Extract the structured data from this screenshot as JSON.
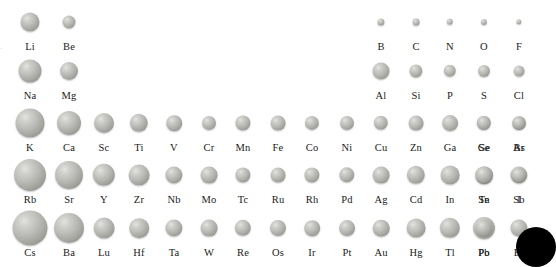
{
  "figure": {
    "type": "scaled-sphere periodic layout",
    "background_color": "#ffffff",
    "sphere_color": "#b4b4b0",
    "label_color": "#1a1a1a",
    "corner_marker_color": "#000000",
    "edge_mark": "."
  },
  "layout": {
    "column_x": [
      30,
      69,
      104,
      139,
      174,
      209,
      243,
      278,
      312,
      347,
      381,
      416,
      450,
      484,
      519
    ],
    "group_columns": 15,
    "row_label_offset_px": 19
  },
  "chart_data": {
    "type": "scatter",
    "xlabel": "",
    "ylabel": "",
    "value_name": "atomic_radius_relative",
    "legend": [],
    "rows": [
      {
        "name": "period-2",
        "sphere_center_y": 22,
        "label_y": 41,
        "elements": [
          {
            "symbol": "Li",
            "col": 0,
            "radius": 9.5
          },
          {
            "symbol": "Be",
            "col": 1,
            "radius": 6.5
          },
          {
            "symbol": "B",
            "col": 10,
            "radius": 3.6
          },
          {
            "symbol": "C",
            "col": 11,
            "radius": 3.4
          },
          {
            "symbol": "N",
            "col": 12,
            "radius": 3.2
          },
          {
            "symbol": "O",
            "col": 13,
            "radius": 3.1
          },
          {
            "symbol": "F",
            "col": 14,
            "radius": 2.7
          }
        ]
      },
      {
        "name": "period-3",
        "sphere_center_y": 71,
        "label_y": 90,
        "elements": [
          {
            "symbol": "Na",
            "col": 0,
            "radius": 11.5
          },
          {
            "symbol": "Mg",
            "col": 1,
            "radius": 9.0
          },
          {
            "symbol": "Al",
            "col": 10,
            "radius": 8.5
          },
          {
            "symbol": "Si",
            "col": 11,
            "radius": 6.6
          },
          {
            "symbol": "P",
            "col": 12,
            "radius": 6.2
          },
          {
            "symbol": "S",
            "col": 13,
            "radius": 6.0
          },
          {
            "symbol": "Cl",
            "col": 14,
            "radius": 5.4
          }
        ]
      },
      {
        "name": "period-4",
        "sphere_center_y": 123,
        "label_y": 142,
        "elements": [
          {
            "symbol": "K",
            "col": 0,
            "radius": 14.5
          },
          {
            "symbol": "Ca",
            "col": 1,
            "radius": 12.0
          },
          {
            "symbol": "Sc",
            "col": 2,
            "radius": 10.0
          },
          {
            "symbol": "Ti",
            "col": 3,
            "radius": 9.2
          },
          {
            "symbol": "V",
            "col": 4,
            "radius": 7.8
          },
          {
            "symbol": "Cr",
            "col": 5,
            "radius": 7.0
          },
          {
            "symbol": "Mn",
            "col": 6,
            "radius": 7.6
          },
          {
            "symbol": "Fe",
            "col": 7,
            "radius": 7.4
          },
          {
            "symbol": "Co",
            "col": 8,
            "radius": 7.1
          },
          {
            "symbol": "Ni",
            "col": 9,
            "radius": 7.0
          },
          {
            "symbol": "Cu",
            "col": 10,
            "radius": 7.2
          },
          {
            "symbol": "Zn",
            "col": 11,
            "radius": 7.4
          },
          {
            "symbol": "Ga",
            "col": 12,
            "radius": 7.9
          },
          {
            "symbol": "Ge",
            "col": 13,
            "radius": 7.2
          },
          {
            "symbol": "As",
            "col": 14,
            "radius": 6.9
          }
        ]
      },
      {
        "name": "period-4b",
        "sphere_center_y": 123,
        "label_y": 142,
        "elements": []
      },
      {
        "name": "period-5",
        "sphere_center_y": 175,
        "label_y": 194,
        "elements": [
          {
            "symbol": "Rb",
            "col": 0,
            "radius": 16.0
          },
          {
            "symbol": "Sr",
            "col": 1,
            "radius": 14.0
          },
          {
            "symbol": "Y",
            "col": 2,
            "radius": 11.2
          },
          {
            "symbol": "Zr",
            "col": 3,
            "radius": 10.4
          },
          {
            "symbol": "Nb",
            "col": 4,
            "radius": 8.6
          },
          {
            "symbol": "Mo",
            "col": 5,
            "radius": 8.4
          },
          {
            "symbol": "Tc",
            "col": 6,
            "radius": 7.6
          },
          {
            "symbol": "Ru",
            "col": 7,
            "radius": 7.4
          },
          {
            "symbol": "Rh",
            "col": 8,
            "radius": 7.6
          },
          {
            "symbol": "Pd",
            "col": 9,
            "radius": 7.7
          },
          {
            "symbol": "Ag",
            "col": 10,
            "radius": 8.4
          },
          {
            "symbol": "Cd",
            "col": 11,
            "radius": 9.2
          },
          {
            "symbol": "In",
            "col": 12,
            "radius": 9.4
          },
          {
            "symbol": "Sn",
            "col": 13,
            "radius": 8.8
          },
          {
            "symbol": "Sb",
            "col": 14,
            "radius": 8.6
          }
        ]
      },
      {
        "name": "period-6",
        "sphere_center_y": 228,
        "label_y": 247,
        "elements": [
          {
            "symbol": "Cs",
            "col": 0,
            "radius": 17.5
          },
          {
            "symbol": "Ba",
            "col": 1,
            "radius": 15.0
          },
          {
            "symbol": "Lu",
            "col": 2,
            "radius": 10.4
          },
          {
            "symbol": "Hf",
            "col": 3,
            "radius": 9.8
          },
          {
            "symbol": "Ta",
            "col": 4,
            "radius": 8.6
          },
          {
            "symbol": "W",
            "col": 5,
            "radius": 8.4
          },
          {
            "symbol": "Re",
            "col": 6,
            "radius": 8.2
          },
          {
            "symbol": "Os",
            "col": 7,
            "radius": 8.0
          },
          {
            "symbol": "Ir",
            "col": 8,
            "radius": 7.8
          },
          {
            "symbol": "Pt",
            "col": 9,
            "radius": 7.9
          },
          {
            "symbol": "Au",
            "col": 10,
            "radius": 8.3
          },
          {
            "symbol": "Hg",
            "col": 11,
            "radius": 9.4
          },
          {
            "symbol": "Tl",
            "col": 12,
            "radius": 10.2
          },
          {
            "symbol": "Pb",
            "col": 13,
            "radius": 11.0
          },
          {
            "symbol": "Bi",
            "col": 14,
            "radius": 8.6
          }
        ]
      }
    ],
    "extra_elements": [
      {
        "symbol": "Se",
        "row": 2,
        "x": 484,
        "sphere_center_y": 123,
        "label_y": 142,
        "radius": 6.7
      },
      {
        "symbol": "Br",
        "row": 2,
        "x": 519,
        "sphere_center_y": 123,
        "label_y": 142,
        "radius": 6.1
      },
      {
        "symbol": "Te",
        "row": 4,
        "x": 484,
        "sphere_center_y": 175,
        "label_y": 194,
        "radius": 8.2
      },
      {
        "symbol": "I",
        "row": 4,
        "x": 519,
        "sphere_center_y": 175,
        "label_y": 194,
        "radius": 7.2
      },
      {
        "symbol": "Po",
        "row": 5,
        "x": 484,
        "sphere_center_y": 228,
        "label_y": 247,
        "radius": 8.2
      }
    ],
    "corner_marker": {
      "x": 536,
      "y": 247,
      "radius": 20
    }
  }
}
